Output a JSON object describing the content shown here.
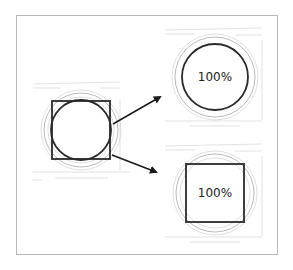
{
  "diagram": {
    "panels": [
      {
        "id": "source",
        "shapes": [
          "square",
          "circle"
        ],
        "label": ""
      },
      {
        "id": "circle-result",
        "shapes": [
          "circle"
        ],
        "label": "100%"
      },
      {
        "id": "square-result",
        "shapes": [
          "square"
        ],
        "label": "100%"
      }
    ],
    "arrows": [
      {
        "from": "source",
        "to": "circle-result"
      },
      {
        "from": "source",
        "to": "square-result"
      }
    ],
    "colors": {
      "stroke": "#2a2a2a",
      "faint": "#c9c9c9",
      "frame": "#b8b8b8"
    }
  }
}
